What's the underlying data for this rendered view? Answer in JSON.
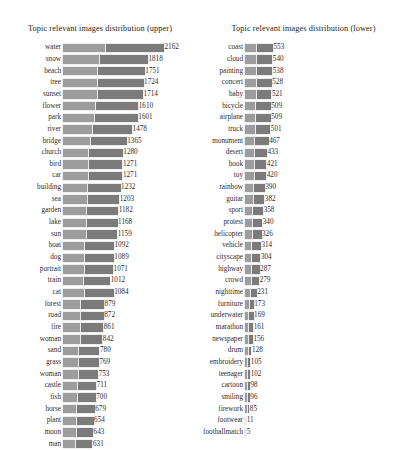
{
  "figure": {
    "background": "#ffffff",
    "bar_color_light": "#9d9d9d",
    "bar_color_dark": "#7b7b7b"
  },
  "panels": {
    "upper": {
      "title": "Topic relevant images distribution (upper)"
    },
    "lower": {
      "title": "Topic relevant images distribution (lower)"
    }
  },
  "chart_data": [
    {
      "type": "bar",
      "orientation": "horizontal",
      "title": "Topic relevant images distribution (upper)",
      "xlabel": "",
      "ylabel": "",
      "grid": false,
      "legend": "none",
      "xlim": [
        0,
        2162
      ],
      "categories": [
        "water",
        "snow",
        "beach",
        "tree",
        "sunset",
        "flower",
        "park",
        "river",
        "bridge",
        "church",
        "bird",
        "car",
        "building",
        "sea",
        "garden",
        "lake",
        "sun",
        "boat",
        "dog",
        "portrait",
        "train",
        "cat",
        "forest",
        "road",
        "fire",
        "woman",
        "sand",
        "grass",
        "woman2",
        "castle",
        "fish",
        "horse",
        "plant",
        "moon",
        "man"
      ],
      "values": [
        2162,
        1818,
        1751,
        1724,
        1714,
        1610,
        1601,
        1478,
        1365,
        1280,
        1271,
        1271,
        1232,
        1203,
        1182,
        1168,
        1159,
        1092,
        1089,
        1071,
        1012,
        1084,
        879,
        872,
        861,
        842,
        780,
        769,
        753,
        711,
        700,
        679,
        654,
        643,
        631
      ]
    },
    {
      "type": "bar",
      "orientation": "horizontal",
      "title": "Topic relevant images distribution (lower)",
      "xlabel": "",
      "ylabel": "",
      "grid": false,
      "legend": "none",
      "xlim": [
        0,
        553
      ],
      "categories": [
        "coast",
        "cloud",
        "painting",
        "concert",
        "baby",
        "bicycle",
        "airplane",
        "truck",
        "monument",
        "desert",
        "book",
        "toy",
        "rainbow",
        "guitar",
        "sport",
        "protest",
        "helicopter",
        "vehicle",
        "cityscape",
        "highway",
        "crowd",
        "nighttime",
        "furniture",
        "underwater",
        "marathon",
        "newspaper",
        "drum",
        "embroidery",
        "teenager",
        "cartoon",
        "smiling",
        "firework",
        "footwear",
        "footballmatch"
      ],
      "values": [
        553,
        540,
        538,
        528,
        521,
        509,
        509,
        501,
        467,
        433,
        421,
        420,
        390,
        382,
        358,
        340,
        326,
        314,
        304,
        287,
        279,
        231,
        173,
        169,
        161,
        156,
        128,
        105,
        102,
        98,
        96,
        85,
        11,
        5
      ]
    }
  ],
  "upper_rows": [
    {
      "label": "water",
      "value": "2162",
      "v": 2162
    },
    {
      "label": "snow",
      "value": "1818",
      "v": 1818
    },
    {
      "label": "beach",
      "value": "1751",
      "v": 1751
    },
    {
      "label": "tree",
      "value": "1724",
      "v": 1724
    },
    {
      "label": "sunset",
      "value": "1714",
      "v": 1714
    },
    {
      "label": "flower",
      "value": "1610",
      "v": 1610
    },
    {
      "label": "park",
      "value": "1601",
      "v": 1601
    },
    {
      "label": "river",
      "value": "1478",
      "v": 1478
    },
    {
      "label": "bridge",
      "value": "1365",
      "v": 1365
    },
    {
      "label": "church",
      "value": "1280",
      "v": 1280
    },
    {
      "label": "bird",
      "value": "1271",
      "v": 1271
    },
    {
      "label": "car",
      "value": "1271",
      "v": 1271
    },
    {
      "label": "building",
      "value": "1232",
      "v": 1232
    },
    {
      "label": "sea",
      "value": "1203",
      "v": 1203
    },
    {
      "label": "garden",
      "value": "1182",
      "v": 1182
    },
    {
      "label": "lake",
      "value": "1168",
      "v": 1168
    },
    {
      "label": "sun",
      "value": "1159",
      "v": 1159
    },
    {
      "label": "boat",
      "value": "1092",
      "v": 1092
    },
    {
      "label": "dog",
      "value": "1089",
      "v": 1089
    },
    {
      "label": "portrait",
      "value": "1071",
      "v": 1071
    },
    {
      "label": "train",
      "value": "1012",
      "v": 1012
    },
    {
      "label": "cat",
      "value": "1084",
      "v": 1084
    },
    {
      "label": "forest",
      "value": "879",
      "v": 879
    },
    {
      "label": "road",
      "value": "872",
      "v": 872
    },
    {
      "label": "fire",
      "value": "861",
      "v": 861
    },
    {
      "label": "woman",
      "value": "842",
      "v": 842
    },
    {
      "label": "sand",
      "value": "780",
      "v": 780
    },
    {
      "label": "grass",
      "value": "769",
      "v": 769
    },
    {
      "label": "woman",
      "value": "753",
      "v": 753
    },
    {
      "label": "castle",
      "value": "711",
      "v": 711
    },
    {
      "label": "fish",
      "value": "700",
      "v": 700
    },
    {
      "label": "horse",
      "value": "679",
      "v": 679
    },
    {
      "label": "plant",
      "value": "654",
      "v": 654
    },
    {
      "label": "moon",
      "value": "643",
      "v": 643
    },
    {
      "label": "man",
      "value": "631",
      "v": 631
    }
  ],
  "lower_rows": [
    {
      "label": "coast",
      "value": "553",
      "v": 553
    },
    {
      "label": "cloud",
      "value": "540",
      "v": 540
    },
    {
      "label": "painting",
      "value": "538",
      "v": 538
    },
    {
      "label": "concert",
      "value": "528",
      "v": 528
    },
    {
      "label": "baby",
      "value": "521",
      "v": 521
    },
    {
      "label": "bicycle",
      "value": "509",
      "v": 509
    },
    {
      "label": "airplane",
      "value": "509",
      "v": 509
    },
    {
      "label": "truck",
      "value": "501",
      "v": 501
    },
    {
      "label": "monument",
      "value": "467",
      "v": 467
    },
    {
      "label": "desert",
      "value": "433",
      "v": 433
    },
    {
      "label": "book",
      "value": "421",
      "v": 421
    },
    {
      "label": "toy",
      "value": "420",
      "v": 420
    },
    {
      "label": "rainbow",
      "value": "390",
      "v": 390
    },
    {
      "label": "guitar",
      "value": "382",
      "v": 382
    },
    {
      "label": "sport",
      "value": "358",
      "v": 358
    },
    {
      "label": "protest",
      "value": "340",
      "v": 340
    },
    {
      "label": "helicopter",
      "value": "326",
      "v": 326
    },
    {
      "label": "vehicle",
      "value": "314",
      "v": 314
    },
    {
      "label": "cityscape",
      "value": "304",
      "v": 304
    },
    {
      "label": "highway",
      "value": "287",
      "v": 287
    },
    {
      "label": "crowd",
      "value": "279",
      "v": 279
    },
    {
      "label": "nighttime",
      "value": "231",
      "v": 231
    },
    {
      "label": "furniture",
      "value": "173",
      "v": 173
    },
    {
      "label": "underwater",
      "value": "169",
      "v": 169
    },
    {
      "label": "marathon",
      "value": "161",
      "v": 161
    },
    {
      "label": "newspaper",
      "value": "156",
      "v": 156
    },
    {
      "label": "drum",
      "value": "128",
      "v": 128
    },
    {
      "label": "embroidery",
      "value": "105",
      "v": 105
    },
    {
      "label": "teenager",
      "value": "102",
      "v": 102
    },
    {
      "label": "cartoon",
      "value": "98",
      "v": 98
    },
    {
      "label": "smiling",
      "value": "96",
      "v": 96
    },
    {
      "label": "firework",
      "value": "85",
      "v": 85
    },
    {
      "label": "footwear",
      "value": "11",
      "v": 11
    },
    {
      "label": "footballmatch",
      "value": "5",
      "v": 5
    }
  ]
}
